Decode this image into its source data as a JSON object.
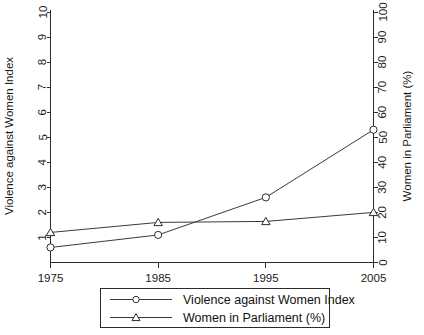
{
  "chart_data": {
    "type": "line",
    "title": "",
    "xlabel": "",
    "ylabel": "Violence against Women Index",
    "y2label": "Women in Parliament (%)",
    "x": [
      1975,
      1985,
      1995,
      2005
    ],
    "xtick_labels": [
      "1975",
      "1985",
      "1995",
      "2005"
    ],
    "xlim": [
      1975,
      2005
    ],
    "ylim": [
      0,
      10
    ],
    "ytick_labels": [
      "1",
      "2",
      "3",
      "4",
      "5",
      "6",
      "7",
      "8",
      "9",
      "10"
    ],
    "yticks": [
      1,
      2,
      3,
      4,
      5,
      6,
      7,
      8,
      9,
      10
    ],
    "y2lim": [
      0,
      100
    ],
    "y2tick_labels": [
      "0",
      "10",
      "20",
      "30",
      "40",
      "50",
      "60",
      "70",
      "80",
      "90",
      "100"
    ],
    "y2ticks": [
      0,
      10,
      20,
      30,
      40,
      50,
      60,
      70,
      80,
      90,
      100
    ],
    "grid": false,
    "legend_position": "bottom-outside",
    "series": [
      {
        "name": "Violence against Women Index",
        "axis": "left",
        "marker": "circle",
        "values": [
          0.6,
          1.1,
          2.6,
          5.3
        ]
      },
      {
        "name": "Women in Parliament (%)",
        "axis": "right",
        "marker": "triangle",
        "values": [
          12,
          16,
          16.4,
          20
        ]
      }
    ]
  },
  "legend": {
    "entries": [
      {
        "label": "Violence against Women Index",
        "marker": "circle"
      },
      {
        "label": "Women in Parliament (%)",
        "marker": "triangle"
      }
    ]
  },
  "colors": {
    "line": "#3a3a3a",
    "axis": "#2b2b2b",
    "text": "#1a1a1a",
    "background": "#ffffff"
  }
}
